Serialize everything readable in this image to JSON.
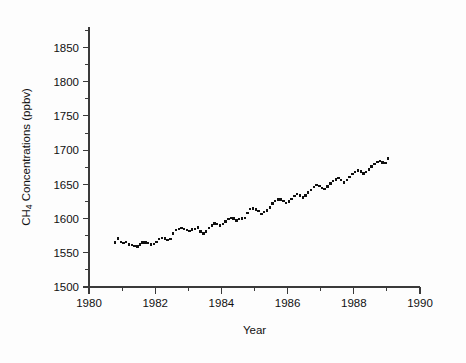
{
  "chart_data": {
    "type": "scatter",
    "title": "",
    "xlabel": "Year",
    "ylabel": "CH4 Concentrations (ppbv)",
    "ylabel_parts": {
      "prefix": "CH",
      "subscript": "4",
      "suffix": " Concentrations (ppbv)"
    },
    "xlim": [
      1980,
      1990
    ],
    "ylim": [
      1500,
      1880
    ],
    "grid": false,
    "legend": null,
    "x_ticks_major": [
      1980,
      1982,
      1984,
      1986,
      1988,
      1990
    ],
    "x_ticklabels": [
      "1980",
      "1982",
      "1984",
      "1986",
      "1988",
      "1990"
    ],
    "x_ticks_minor": [
      1981,
      1983,
      1985,
      1987,
      1989
    ],
    "y_ticks_major": [
      1500,
      1550,
      1600,
      1650,
      1700,
      1750,
      1800,
      1850
    ],
    "y_ticklabels": [
      "1500",
      "1550",
      "1600",
      "1650",
      "1700",
      "1750",
      "1800",
      "1850"
    ],
    "y_ticks_minor": [
      1525,
      1575,
      1625,
      1675,
      1725,
      1775,
      1825,
      1875
    ],
    "marker": "square",
    "marker_size": 2.4,
    "marker_color": "#101010",
    "series": [
      {
        "name": "CH4 monthly mean",
        "x": [
          1980.79,
          1980.87,
          1980.96,
          1981.04,
          1981.12,
          1981.21,
          1981.29,
          1981.37,
          1981.46,
          1981.54,
          1981.62,
          1981.71,
          1981.79,
          1981.87,
          1981.96,
          1982.04,
          1982.12,
          1982.21,
          1982.29,
          1982.37,
          1982.46,
          1982.54,
          1982.62,
          1982.71,
          1982.79,
          1982.87,
          1982.96,
          1983.04,
          1983.12,
          1983.21,
          1983.29,
          1983.37,
          1983.46,
          1983.54,
          1983.62,
          1983.71,
          1983.79,
          1983.87,
          1983.96,
          1984.04,
          1984.12,
          1984.21,
          1984.29,
          1984.37,
          1984.46,
          1984.54,
          1984.62,
          1984.71,
          1984.79,
          1984.87,
          1984.96,
          1985.04,
          1985.12,
          1985.21,
          1985.29,
          1985.37,
          1985.46,
          1985.54,
          1985.62,
          1985.71,
          1985.79,
          1985.87,
          1985.96,
          1986.04,
          1986.12,
          1986.21,
          1986.29,
          1986.37,
          1986.46,
          1986.54,
          1986.62,
          1986.71,
          1986.79,
          1986.87,
          1986.96,
          1987.04,
          1987.12,
          1987.21,
          1987.29,
          1987.37,
          1987.46,
          1987.54,
          1987.62,
          1987.71,
          1987.79,
          1987.87,
          1987.96,
          1988.04,
          1988.12,
          1988.21,
          1988.29,
          1988.37,
          1988.46,
          1988.54,
          1988.62,
          1988.71,
          1988.79,
          1988.87,
          1988.96,
          1989.04
        ],
        "y": [
          1565,
          1571,
          1566,
          1564,
          1566,
          1562,
          1561,
          1560,
          1559,
          1562,
          1565,
          1565,
          1564,
          1562,
          1563,
          1566,
          1570,
          1572,
          1571,
          1569,
          1570,
          1578,
          1583,
          1585,
          1586,
          1585,
          1583,
          1582,
          1584,
          1585,
          1587,
          1581,
          1578,
          1581,
          1586,
          1590,
          1593,
          1592,
          1590,
          1592,
          1596,
          1599,
          1601,
          1600,
          1597,
          1599,
          1600,
          1601,
          1608,
          1614,
          1615,
          1613,
          1611,
          1607,
          1610,
          1612,
          1616,
          1622,
          1626,
          1628,
          1628,
          1626,
          1623,
          1625,
          1629,
          1633,
          1636,
          1634,
          1631,
          1634,
          1638,
          1642,
          1646,
          1649,
          1648,
          1645,
          1643,
          1647,
          1651,
          1655,
          1657,
          1659,
          1656,
          1653,
          1656,
          1661,
          1665,
          1668,
          1670,
          1669,
          1666,
          1668,
          1672,
          1676,
          1680,
          1683,
          1684,
          1682,
          1681,
          1688
        ]
      }
    ]
  }
}
